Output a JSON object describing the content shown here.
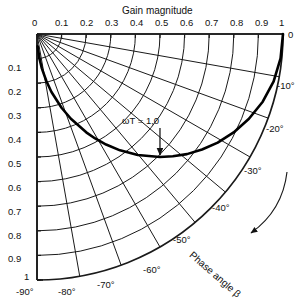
{
  "chart_data": {
    "type": "line",
    "title": "Gain magnitude",
    "subtitle": "",
    "xlabel": "Gain magnitude",
    "ylabel": "",
    "secondary_axis_label": "Phase angle  β",
    "grid": "polar",
    "legend": "none",
    "x_axis": {
      "label": "Gain magnitude",
      "position": "top",
      "range": [
        0,
        1
      ],
      "ticks": [
        "0",
        "0.1",
        "0.2",
        "0.3",
        "0.4",
        "0.5",
        "0.6",
        "0.7",
        "0.8",
        "0.9",
        "1"
      ],
      "tick_values": [
        0,
        0.1,
        0.2,
        0.3,
        0.4,
        0.5,
        0.6,
        0.7,
        0.8,
        0.9,
        1.0
      ]
    },
    "y_axis": {
      "label": "",
      "position": "left",
      "range": [
        0,
        1
      ],
      "ticks": [
        "0",
        "0.1",
        "0.2",
        "0.3",
        "0.4",
        "0.5",
        "0.6",
        "0.7",
        "0.8",
        "0.9",
        "1"
      ],
      "tick_values": [
        0,
        0.1,
        0.2,
        0.3,
        0.4,
        0.5,
        0.6,
        0.7,
        0.8,
        0.9,
        1.0
      ]
    },
    "phase_axis": {
      "label": "Phase angle  β",
      "ticks": [
        "0",
        "-10°",
        "-20°",
        "-30°",
        "-40°",
        "-50°",
        "-60°",
        "-70°",
        "-80°",
        "-90°"
      ],
      "tick_values": [
        0,
        -10,
        -20,
        -30,
        -40,
        -50,
        -60,
        -70,
        -80,
        -90
      ]
    },
    "gain_arcs": [
      0.1,
      0.2,
      0.3,
      0.4,
      0.5,
      0.6,
      0.7,
      0.8,
      0.9,
      1.0
    ],
    "phase_radials": [
      0,
      -10,
      -20,
      -30,
      -40,
      -50,
      -60,
      -70,
      -80,
      -90
    ],
    "annotations": [
      {
        "text": "ωT = 1,0",
        "points_to_phase": -45,
        "points_to_magnitude": 0.707
      },
      {
        "text": "Phase angle  β",
        "type": "axis-name-with-arrow"
      }
    ],
    "series": [
      {
        "name": "Gain locus",
        "style": "bold",
        "wT": [
          0,
          0.1,
          0.2,
          0.3,
          0.4,
          0.5,
          0.6,
          0.7,
          0.8,
          0.9,
          1.0,
          1.2,
          1.4,
          1.6,
          1.8,
          2.0,
          2.5,
          3.0,
          4.0,
          5.0,
          7.0,
          10.0,
          20.0
        ],
        "magnitude": [
          1.0,
          0.995,
          0.981,
          0.958,
          0.928,
          0.894,
          0.857,
          0.819,
          0.781,
          0.743,
          0.707,
          0.64,
          0.581,
          0.53,
          0.486,
          0.447,
          0.371,
          0.316,
          0.243,
          0.196,
          0.142,
          0.1,
          0.05
        ],
        "phase_deg": [
          0,
          -5.7,
          -11.3,
          -16.7,
          -21.8,
          -26.6,
          -31.0,
          -35.0,
          -38.7,
          -42.0,
          -45.0,
          -50.2,
          -54.5,
          -58.0,
          -60.9,
          -63.4,
          -68.2,
          -71.6,
          -76.0,
          -78.7,
          -81.9,
          -84.3,
          -87.1
        ]
      }
    ]
  },
  "labels": {
    "title": "Gain magnitude",
    "phase_axis_name": "Phase angle  β",
    "annotation_wt": "ωT = 1,0",
    "top_ticks": [
      "0",
      "0.1",
      "0.2",
      "0.3",
      "0.4",
      "0.5",
      "0.6",
      "0.7",
      "0.8",
      "0.9",
      "1"
    ],
    "left_ticks": [
      "0.1",
      "0.2",
      "0.3",
      "0.4",
      "0.5",
      "0.6",
      "0.7",
      "0.8",
      "0.9",
      "1"
    ],
    "right_ticks": [
      "0",
      "-10°",
      "-20°",
      "-30°"
    ],
    "inner_ticks": [
      "-40°",
      "-50°"
    ],
    "bottom_ticks": [
      "-60°",
      "-70°",
      "-80°",
      "-90°"
    ]
  },
  "colors": {
    "ink": "#111111",
    "background": "#ffffff",
    "grid": "#1a1a1a",
    "curve": "#000000"
  }
}
